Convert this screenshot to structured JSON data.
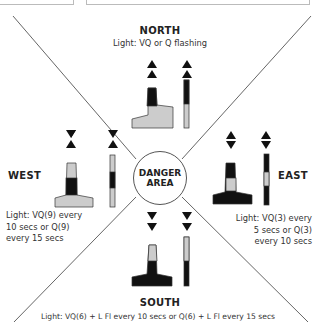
{
  "colors": {
    "black": "#111111",
    "light_grey": "#cccccc",
    "line": "#666666"
  },
  "center": {
    "line1": "DANGER",
    "line2": "AREA"
  },
  "north": {
    "title": "NORTH",
    "light": "Light: VQ or Q flashing",
    "topmark": "two cones pointing up"
  },
  "east": {
    "title": "EAST",
    "light_lines": [
      "Light: VQ(3) every",
      "5 secs or Q(3)",
      "every 10 secs"
    ],
    "topmark": "cones base to base"
  },
  "south": {
    "title": "SOUTH",
    "light": "Light: VQ(6) + L Fl every 10 secs or Q(6) + L Fl every 15 secs",
    "topmark": "two cones pointing down"
  },
  "west": {
    "title": "WEST",
    "light_lines": [
      "Light: VQ(9) every",
      "10 secs or Q(9)",
      "every 15 secs"
    ],
    "topmark": "cones point to point"
  }
}
